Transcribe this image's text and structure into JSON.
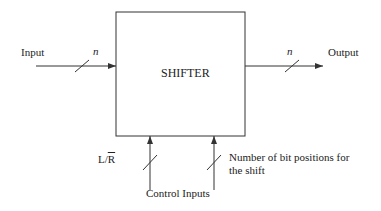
{
  "diagram": {
    "block": {
      "label": "SHIFTER"
    },
    "input": {
      "label": "Input",
      "width_label": "n"
    },
    "output": {
      "label": "Output",
      "width_label": "n"
    },
    "control": {
      "group_label": "Control Inputs",
      "direction": {
        "label_prefix": "L/",
        "label_overbar": "R"
      },
      "shift_amount": {
        "line1": "Number of bit positions for",
        "line2": "the shift"
      }
    },
    "colors": {
      "stroke": "#333333",
      "background": "#ffffff"
    }
  }
}
